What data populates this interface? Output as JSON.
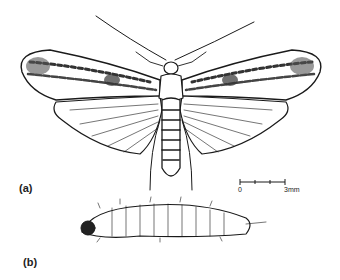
{
  "figure": {
    "panels": [
      {
        "label": "(a)",
        "subject": "adult moth, dorsal view"
      },
      {
        "label": "(b)",
        "subject": "larva, lateral view"
      }
    ],
    "scale_bar": {
      "start": "0",
      "end": "3mm"
    },
    "colors": {
      "ink": "#1a1a1a",
      "background": "#ffffff"
    }
  }
}
